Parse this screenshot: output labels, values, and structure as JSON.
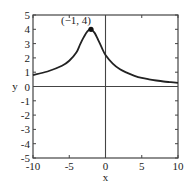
{
  "chart_data": {
    "type": "line",
    "title": "",
    "xlabel": "x",
    "ylabel": "y",
    "xlim": [
      -10,
      10
    ],
    "ylim": [
      -5,
      5
    ],
    "grid": false,
    "legend": null,
    "xticks": [
      -10,
      -5,
      0,
      5,
      10
    ],
    "xtick_labels": [
      "-10",
      "-5",
      "0",
      "5",
      "10"
    ],
    "yticks": [
      -5,
      -4,
      -3,
      -2,
      -1,
      0,
      1,
      2,
      3,
      4,
      5
    ],
    "ytick_labels": [
      "-5",
      "-4",
      "-3",
      "-2",
      "-1",
      "0",
      "1",
      "2",
      "3",
      "4",
      "5"
    ],
    "axes_lines": {
      "x_axis_at_y": 0,
      "y_axis_at_x": 0
    },
    "series": [
      {
        "name": "curve",
        "x": [
          -10,
          -8,
          -6,
          -5,
          -4,
          -3.5,
          -3,
          -2.5,
          -2,
          -1.5,
          -1,
          -0.5,
          0,
          1,
          2,
          3,
          4,
          5,
          6,
          7,
          8,
          9,
          10
        ],
        "y": [
          0.8,
          1.05,
          1.45,
          1.8,
          2.4,
          2.95,
          3.45,
          3.85,
          4.0,
          3.75,
          3.25,
          2.7,
          2.2,
          1.6,
          1.2,
          0.95,
          0.75,
          0.6,
          0.5,
          0.42,
          0.35,
          0.3,
          0.25
        ]
      }
    ],
    "annotations": [
      {
        "text": "(−1, 4)",
        "point": {
          "x": -2,
          "y": 4
        },
        "marker": "filled-circle"
      }
    ]
  },
  "labels": {
    "x_axis": "x",
    "y_axis": "y",
    "peak": "(−1, 4)"
  }
}
